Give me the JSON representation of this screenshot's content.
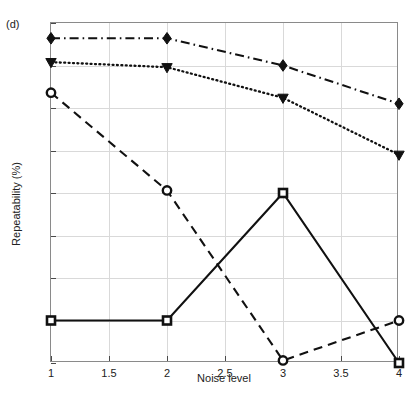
{
  "figure": {
    "panel_label": "(d)",
    "background_color": "#ffffff",
    "line_color": "#111111",
    "grid_color": "#d9d9d9",
    "axis_color": "#8a8a8a"
  },
  "chart_data": {
    "type": "line",
    "title": "",
    "subtitle": "",
    "panel": "(d)",
    "xlabel": "Noise level",
    "ylabel": "Repeatability (%)",
    "xlim": [
      1,
      4
    ],
    "ylim": [
      50,
      90
    ],
    "grid": true,
    "legend": "none",
    "xticks": [
      1,
      1.5,
      2,
      2.5,
      3,
      3.5,
      4
    ],
    "xtick_labels": [
      "1",
      "1.5",
      "2",
      "2.5",
      "3",
      "3.5",
      "4"
    ],
    "yticks": [
      50,
      55,
      60,
      65,
      70,
      75,
      80,
      85,
      90
    ],
    "ytick_labels": [
      "50",
      "55",
      "60",
      "65",
      "70",
      "75",
      "80",
      "85",
      "90"
    ],
    "x": [
      1,
      2,
      3,
      4
    ],
    "series": [
      {
        "name": "series-diamond",
        "marker": "diamond",
        "linestyle": "dashdot",
        "color": "#111111",
        "values": [
          88.2,
          88.2,
          85.0,
          80.5
        ]
      },
      {
        "name": "series-triangle-down",
        "marker": "triangle-down",
        "linestyle": "dotted",
        "color": "#111111",
        "values": [
          85.4,
          84.8,
          81.2,
          74.5
        ]
      },
      {
        "name": "series-circle",
        "marker": "circle",
        "linestyle": "dashed",
        "color": "#111111",
        "values": [
          81.8,
          70.3,
          50.3,
          55.0
        ]
      },
      {
        "name": "series-square",
        "marker": "square",
        "linestyle": "solid",
        "color": "#111111",
        "values": [
          55.0,
          55.0,
          70.0,
          50.0
        ]
      }
    ]
  }
}
